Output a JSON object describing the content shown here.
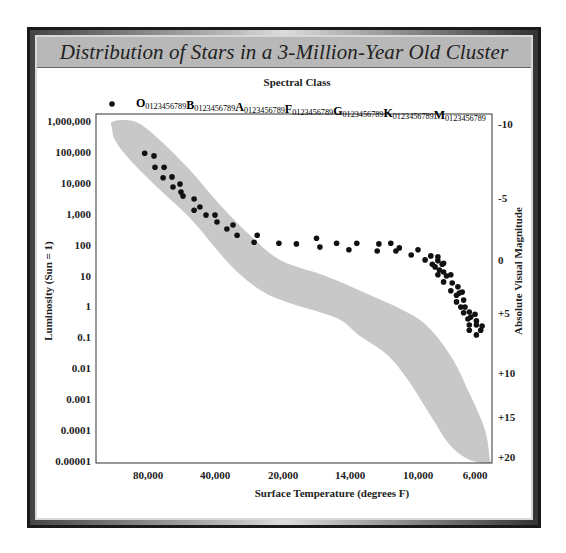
{
  "chart_data": {
    "type": "scatter",
    "title": "Distribution of Stars in a 3-Million-Year Old Cluster",
    "top_axis_label": "Spectral Class",
    "spectral_classes": [
      "O",
      "B",
      "A",
      "F",
      "G",
      "K",
      "M"
    ],
    "spectral_subdivisions": "0123456789",
    "legend_marker": "dot",
    "xlabel": "Surface Temperature (degrees F)",
    "ylabel": "Luminosity (Sun = 1)",
    "y2label": "Absolute Visual Magnitude",
    "x_ticks": [
      {
        "value": 80000,
        "label": "80,000"
      },
      {
        "value": 40000,
        "label": "40,000"
      },
      {
        "value": 20000,
        "label": "20,000"
      },
      {
        "value": 14000,
        "label": "14,000"
      },
      {
        "value": 10000,
        "label": "10,000"
      },
      {
        "value": 6000,
        "label": "6,000"
      }
    ],
    "x_direction": "decreasing",
    "y_scale": "log",
    "ylim": [
      1e-05,
      1000000
    ],
    "y_ticks": [
      {
        "value": 1000000,
        "label": "1,000,000"
      },
      {
        "value": 100000,
        "label": "100,000"
      },
      {
        "value": 10000,
        "label": "10,000"
      },
      {
        "value": 1000,
        "label": "1,000"
      },
      {
        "value": 100,
        "label": "100"
      },
      {
        "value": 10,
        "label": "10"
      },
      {
        "value": 1,
        "label": "1"
      },
      {
        "value": 0.1,
        "label": "0.1"
      },
      {
        "value": 0.01,
        "label": "0.01"
      },
      {
        "value": 0.001,
        "label": "0.001"
      },
      {
        "value": 0.0001,
        "label": "0.0001"
      },
      {
        "value": 1e-05,
        "label": "0.00001"
      }
    ],
    "y2_ticks": [
      {
        "luminosity": 800000,
        "label": "-10"
      },
      {
        "luminosity": 3300,
        "label": "-5"
      },
      {
        "luminosity": 32,
        "label": "0"
      },
      {
        "luminosity": 0.6,
        "label": "+5"
      },
      {
        "luminosity": 0.007,
        "label": "+10"
      },
      {
        "luminosity": 0.00026,
        "label": "+15"
      },
      {
        "luminosity": 1.3e-05,
        "label": "+20"
      }
    ],
    "main_sequence_band": {
      "name": "Main sequence",
      "color": "#c8c8c8",
      "upper_edge": [
        [
          101500,
          930000
        ],
        [
          93700,
          1080000
        ],
        [
          84800,
          800000
        ],
        [
          72800,
          240000
        ],
        [
          54900,
          26000
        ],
        [
          38500,
          1900
        ],
        [
          29700,
          200
        ],
        [
          20900,
          32
        ],
        [
          16500,
          10.5
        ],
        [
          12800,
          2.3
        ],
        [
          9860,
          0.36
        ],
        [
          7750,
          0.027
        ],
        [
          6350,
          0.0014
        ],
        [
          5300,
          0.0001
        ],
        [
          4950,
          1.07e-05
        ]
      ],
      "lower_edge": [
        [
          4950,
          8.5e-06
        ],
        [
          6350,
          1.07e-05
        ],
        [
          7750,
          3.2e-05
        ],
        [
          9150,
          0.00031
        ],
        [
          10600,
          0.0042
        ],
        [
          11800,
          0.027
        ],
        [
          13500,
          0.12
        ],
        [
          15200,
          0.42
        ],
        [
          19700,
          1.4
        ],
        [
          26700,
          3.4
        ],
        [
          35500,
          22
        ],
        [
          54900,
          720
        ],
        [
          72800,
          5900
        ],
        [
          90700,
          55000
        ],
        [
          99700,
          245000
        ],
        [
          101500,
          590000
        ]
      ]
    },
    "series": [
      {
        "name": "Cluster stars",
        "color": "#111111",
        "points": [
          [
            82000,
            91000
          ],
          [
            76400,
            74000
          ],
          [
            75800,
            32000
          ],
          [
            70400,
            32000
          ],
          [
            71000,
            14500
          ],
          [
            65700,
            15500
          ],
          [
            65100,
            7300
          ],
          [
            60900,
            9100
          ],
          [
            60300,
            5000
          ],
          [
            59100,
            3700
          ],
          [
            52500,
            3000
          ],
          [
            49000,
            1650
          ],
          [
            52500,
            1300
          ],
          [
            45400,
            900
          ],
          [
            40000,
            900
          ],
          [
            39400,
            540
          ],
          [
            34700,
            430
          ],
          [
            36500,
            320
          ],
          [
            33500,
            200
          ],
          [
            27600,
            200
          ],
          [
            28500,
            120
          ],
          [
            21200,
            110
          ],
          [
            18800,
            105
          ],
          [
            17000,
            160
          ],
          [
            16700,
            83
          ],
          [
            15200,
            110
          ],
          [
            14100,
            68
          ],
          [
            13600,
            110
          ],
          [
            12300,
            105
          ],
          [
            12400,
            62
          ],
          [
            11600,
            110
          ],
          [
            11300,
            62
          ],
          [
            11100,
            78
          ],
          [
            10400,
            46
          ],
          [
            10000,
            68
          ],
          [
            9500,
            32
          ],
          [
            9100,
            43
          ],
          [
            9000,
            23
          ],
          [
            8600,
            40
          ],
          [
            8600,
            30
          ],
          [
            8800,
            19
          ],
          [
            8300,
            23
          ],
          [
            8200,
            25
          ],
          [
            8500,
            15
          ],
          [
            8200,
            13
          ],
          [
            8600,
            10.5
          ],
          [
            8000,
            9.6
          ],
          [
            7700,
            10.5
          ],
          [
            8200,
            6.2
          ],
          [
            7600,
            5.7
          ],
          [
            7200,
            4.3
          ],
          [
            7700,
            3.2
          ],
          [
            7300,
            2.3
          ],
          [
            6900,
            2.9
          ],
          [
            7100,
            2.7
          ],
          [
            7300,
            1.4
          ],
          [
            6800,
            1.6
          ],
          [
            7000,
            0.95
          ],
          [
            6700,
            0.95
          ],
          [
            6800,
            0.62
          ],
          [
            6400,
            0.66
          ],
          [
            6000,
            0.56
          ],
          [
            6500,
            0.39
          ],
          [
            6300,
            0.45
          ],
          [
            5900,
            0.34
          ],
          [
            6400,
            0.25
          ],
          [
            5900,
            0.25
          ],
          [
            5500,
            0.23
          ],
          [
            6400,
            0.17
          ],
          [
            5600,
            0.17
          ],
          [
            5900,
            0.12
          ]
        ]
      }
    ]
  }
}
